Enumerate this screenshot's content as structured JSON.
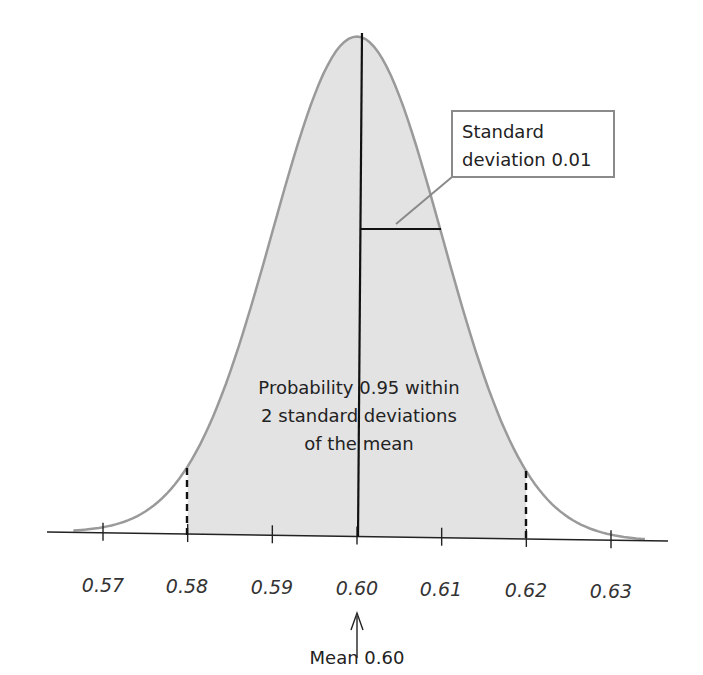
{
  "chart_data": {
    "type": "area",
    "title": "",
    "distribution": "normal",
    "mean": 0.6,
    "std_dev": 0.01,
    "x_ticks": [
      "0.57",
      "0.58",
      "0.59",
      "0.60",
      "0.61",
      "0.62",
      "0.63"
    ],
    "xlim": [
      0.565,
      0.635
    ],
    "shaded_region": [
      0.58,
      0.62
    ],
    "shaded_probability": 0.95,
    "annotations": {
      "sd_box": [
        "Standard",
        "deviation 0.01"
      ],
      "center_text": [
        "Probability 0.95 within",
        "2 standard deviations",
        "of the mean"
      ],
      "mean_label": "Mean 0.60"
    },
    "colors": {
      "fill": "#e3e3e3",
      "curve": "#9a9a9a",
      "lines": "#111111"
    }
  }
}
